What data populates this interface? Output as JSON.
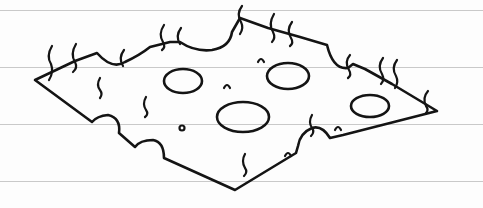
{
  "image": {
    "description": "Hand-drawn line sketch of a flat slab of Swiss cheese on lined notebook paper",
    "subject": "cheese-slice-icon",
    "paper": {
      "background": "#fdfdfd",
      "ruled_line_color": "#c9c9c9",
      "ruled_lines_y": [
        10,
        67,
        124,
        181
      ]
    },
    "ink_color": "#141414",
    "holes": [
      {
        "label": "hole-top-left",
        "cx": 183,
        "cy": 81,
        "rx": 19,
        "ry": 12
      },
      {
        "label": "hole-top-center",
        "cx": 288,
        "cy": 76,
        "rx": 21,
        "ry": 13
      },
      {
        "label": "hole-center-large",
        "cx": 243,
        "cy": 117,
        "rx": 26,
        "ry": 15
      },
      {
        "label": "hole-right",
        "cx": 370,
        "cy": 106,
        "rx": 19,
        "ry": 11
      }
    ]
  }
}
